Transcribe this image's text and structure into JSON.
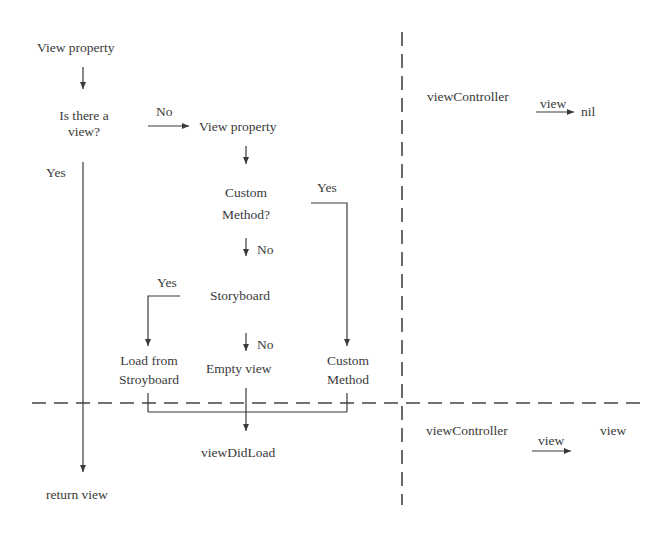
{
  "flow": {
    "start": "View property",
    "decision_view_line1": "Is there a",
    "decision_view_line2": "view?",
    "no_label_1": "No",
    "view_property_2": "View property",
    "yes_label_1": "Yes",
    "custom_method_q_line1": "Custom",
    "custom_method_q_line2": "Method?",
    "yes_label_2": "Yes",
    "no_label_2": "No",
    "storyboard": "Storyboard",
    "yes_label_3": "Yes",
    "no_label_3": "No",
    "load_from_line1": "Load from",
    "load_from_line2": "Stroyboard",
    "empty_view": "Empty view",
    "custom_method_line1": "Custom",
    "custom_method_line2": "Method",
    "view_did_load": "viewDidLoad",
    "return_view": "return view"
  },
  "state_top": {
    "controller": "viewController",
    "arrow_label": "view",
    "target": "nil"
  },
  "state_bottom": {
    "controller": "viewController",
    "arrow_label": "view",
    "target": "view"
  },
  "colors": {
    "line": "#3a3a3a",
    "text": "#3a3a3a",
    "background": "#ffffff"
  }
}
